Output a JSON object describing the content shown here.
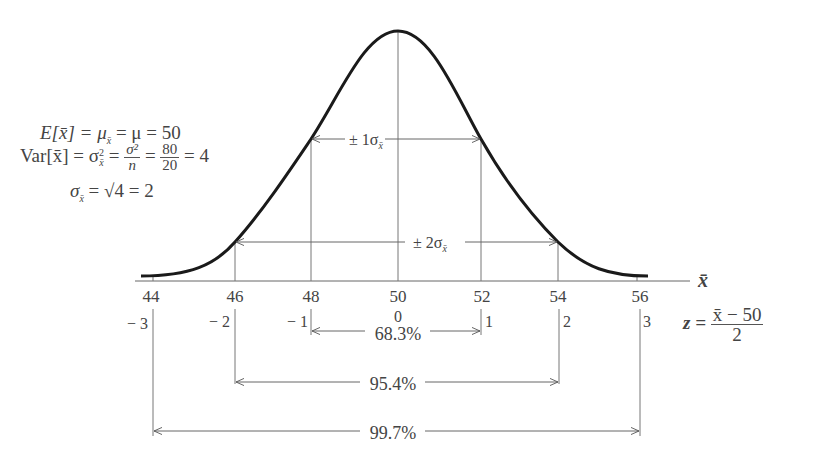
{
  "diagram": {
    "axis": {
      "x_label": "x̄",
      "ticks": [
        "44",
        "46",
        "48",
        "50",
        "52",
        "54",
        "56"
      ],
      "z_ticks": [
        "− 3",
        "− 2",
        "− 1",
        "0",
        "1",
        "2",
        "3"
      ]
    },
    "formulas": {
      "mean_line": "E[x̄] = μ",
      "mean_sub": "x̄",
      "mean_rest": " = μ = 50",
      "var_prefix": "Var[x̄] = σ",
      "var_sup": "2",
      "var_sub": "x̄",
      "var_eq": " = ",
      "var_frac_num": "σ²",
      "var_frac_den": "n",
      "var_frac2_num": "80",
      "var_frac2_den": "20",
      "var_result": " = 4",
      "sd_prefix": "σ",
      "sd_sub": "x̄",
      "sd_rest": " = √4 = 2",
      "z_prefix": "z = ",
      "z_num": "x̄ − 50",
      "z_den": "2"
    },
    "intervals": {
      "one_sigma": "± 1σ",
      "one_sigma_sub": "x̄",
      "two_sigma": "± 2σ",
      "two_sigma_sub": "x̄",
      "pct_68": "68.3%",
      "pct_95": "95.4%",
      "pct_99": "99.7%"
    },
    "colors": {
      "curve": "#1a1a1a",
      "lines": "#666666",
      "text": "#444444"
    }
  }
}
